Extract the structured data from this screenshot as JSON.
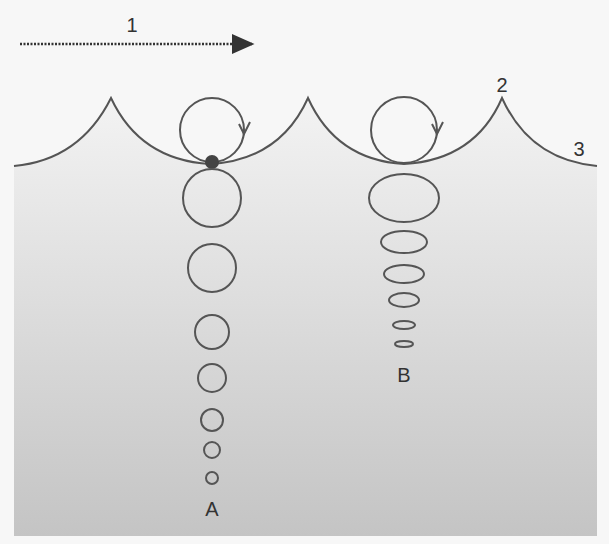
{
  "diagram": {
    "labels": {
      "wind_direction": "1",
      "crest": "2",
      "surface": "3",
      "deep_column": "A",
      "shallow_column": "B"
    },
    "colors": {
      "background": "#f7f7f7",
      "water_top": "#f0f0f0",
      "water_bottom": "#c6c6c6",
      "stroke": "#555555",
      "particle": "#444444"
    },
    "wave": {
      "crests_x": [
        111,
        308,
        502
      ],
      "crest_y": 98,
      "troughs_x": [
        210,
        404
      ],
      "trough_y": 164,
      "left_edge_y": 166,
      "right_edge_y": 166
    },
    "column_a": {
      "x": 212,
      "orbits": [
        {
          "cy": 130,
          "r": 32
        },
        {
          "cy": 198,
          "r": 29
        },
        {
          "cy": 268,
          "r": 24
        },
        {
          "cy": 332,
          "r": 17
        },
        {
          "cy": 378,
          "r": 14
        },
        {
          "cy": 420,
          "r": 11
        },
        {
          "cy": 450,
          "r": 8
        },
        {
          "cy": 478,
          "r": 6
        }
      ]
    },
    "column_b": {
      "x": 404,
      "orbits": [
        {
          "cy": 130,
          "rx": 33,
          "ry": 33
        },
        {
          "cy": 198,
          "rx": 35,
          "ry": 24
        },
        {
          "cy": 242,
          "rx": 23,
          "ry": 11
        },
        {
          "cy": 274,
          "rx": 20,
          "ry": 9
        },
        {
          "cy": 300,
          "rx": 15,
          "ry": 7
        },
        {
          "cy": 325,
          "rx": 11,
          "ry": 4
        },
        {
          "cy": 344,
          "rx": 9,
          "ry": 3
        }
      ]
    }
  }
}
